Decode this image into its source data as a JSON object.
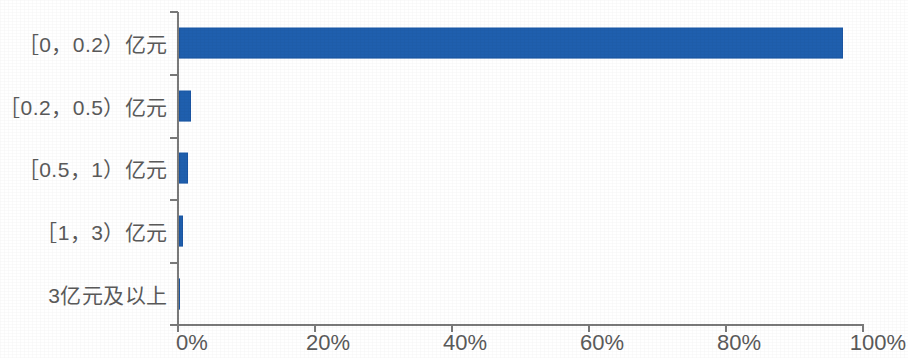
{
  "chart_data": {
    "type": "bar",
    "orientation": "horizontal",
    "title": "",
    "xlabel": "",
    "ylabel": "",
    "categories": [
      "［0，0.2）亿元",
      "［0.2，0.5）亿元",
      "［0.5，1）亿元",
      "［1，3）亿元",
      "3亿元及以上"
    ],
    "values": [
      96.9,
      1.7,
      1.3,
      0.6,
      0.0
    ],
    "value_unit": "%",
    "xlim": [
      0,
      100
    ],
    "x_ticks": [
      0,
      20,
      40,
      60,
      80,
      100
    ],
    "x_tick_labels": [
      "0%",
      "20%",
      "40%",
      "60%",
      "80%",
      "100%"
    ],
    "grid": false,
    "legend": null,
    "series": [
      {
        "name": "占比",
        "values": [
          96.9,
          1.7,
          1.3,
          0.6,
          0.0
        ]
      }
    ],
    "colors": {
      "bar": "#1f5fae",
      "axis": "#7a7a7a",
      "text": "#5a5a5a",
      "background": "#ffffff"
    }
  }
}
